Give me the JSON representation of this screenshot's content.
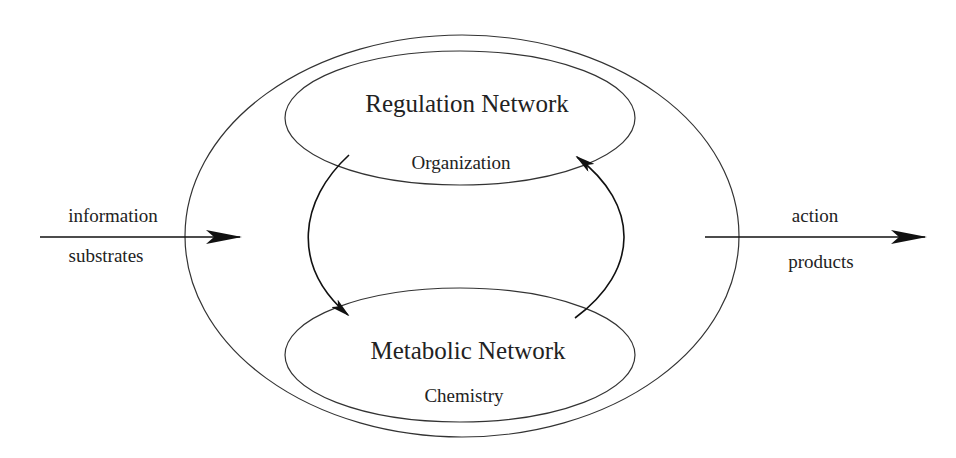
{
  "diagram": {
    "outer_system": {
      "label": ""
    },
    "regulation": {
      "title": "Regulation Network",
      "subtitle": "Organization"
    },
    "metabolic": {
      "title": "Metabolic Network",
      "subtitle": "Chemistry"
    },
    "input": {
      "top_label": "information",
      "bottom_label": "substrates"
    },
    "output": {
      "top_label": "action",
      "bottom_label": "products"
    },
    "colors": {
      "stroke": "#333333",
      "text": "#222222",
      "background": "#ffffff"
    }
  }
}
